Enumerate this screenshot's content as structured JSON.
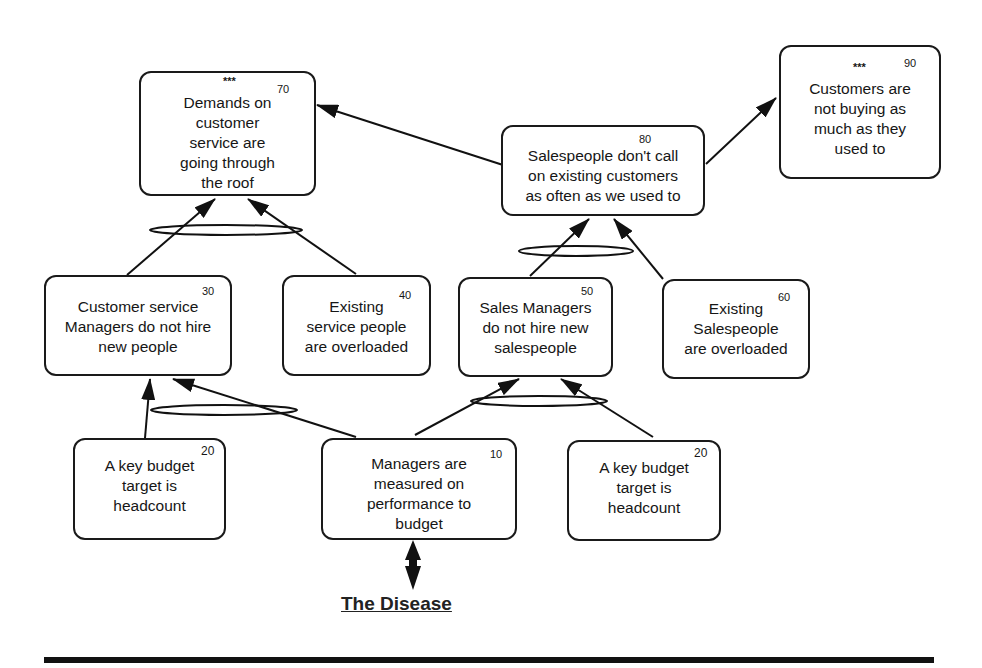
{
  "diagram": {
    "title": "The Disease",
    "nodes": [
      {
        "id": 70,
        "number": "70",
        "stars": "***",
        "label": "Demands on customer service are going through the roof"
      },
      {
        "id": 80,
        "number": "80",
        "label": "Salespeople  don't call on existing customers as often as we used to"
      },
      {
        "id": 90,
        "number": "90",
        "stars": "***",
        "label": "Customers are not buying as much as they used to"
      },
      {
        "id": 30,
        "number": "30",
        "label": "Customer service Managers do not hire new people"
      },
      {
        "id": 40,
        "number": "40",
        "label": "Existing service people are overloaded"
      },
      {
        "id": 50,
        "number": "50",
        "label": "Sales Managers do not hire new salespeople"
      },
      {
        "id": 60,
        "number": "60",
        "label": "Existing Salespeople are overloaded"
      },
      {
        "id": "20a",
        "number": "20",
        "label": "A key budget target is headcount"
      },
      {
        "id": 10,
        "number": "10",
        "label": "Managers are measured on performance to budget"
      },
      {
        "id": "20b",
        "number": "20",
        "label": "A key budget target is headcount"
      }
    ],
    "edges": [
      {
        "from": "80",
        "to": "70"
      },
      {
        "from": "80",
        "to": "90"
      },
      {
        "from": "30",
        "to": "70",
        "and_group": "A"
      },
      {
        "from": "40",
        "to": "70",
        "and_group": "A"
      },
      {
        "from": "50",
        "to": "80",
        "and_group": "B"
      },
      {
        "from": "60",
        "to": "80",
        "and_group": "B"
      },
      {
        "from": "20a",
        "to": "30",
        "and_group": "C"
      },
      {
        "from": "10",
        "to": "30",
        "and_group": "C"
      },
      {
        "from": "10",
        "to": "50",
        "and_group": "D"
      },
      {
        "from": "20b",
        "to": "50",
        "and_group": "D"
      },
      {
        "from": "10",
        "to": "title",
        "type": "bidirectional"
      }
    ]
  },
  "nodes": {
    "n70": {
      "num": "70",
      "stars": "***",
      "l1": "Demands on",
      "l2": "customer",
      "l3": "service are",
      "l4": "going through",
      "l5": "the roof"
    },
    "n80": {
      "num": "80",
      "l1": "Salespeople  don't call",
      "l2": "on existing customers",
      "l3": "as often as we used to"
    },
    "n90": {
      "num": "90",
      "stars": "***",
      "l1": "Customers are",
      "l2": "not buying as",
      "l3": "much as they",
      "l4": "used to"
    },
    "n30": {
      "num": "30",
      "l1": "Customer service",
      "l2": "Managers do not hire",
      "l3": "new people"
    },
    "n40": {
      "num": "40",
      "l1": "Existing",
      "l2": "service people",
      "l3": "are overloaded"
    },
    "n50": {
      "num": "50",
      "l1": "Sales Managers",
      "l2": "do not hire new",
      "l3": "salespeople"
    },
    "n60": {
      "num": "60",
      "l1": "Existing",
      "l2": "Salespeople",
      "l3": "are overloaded"
    },
    "n20a": {
      "num": "20",
      "l1": "A key budget",
      "l2": "target is",
      "l3": "headcount"
    },
    "n10": {
      "num": "10",
      "l1": "Managers are",
      "l2": "measured on",
      "l3": "performance to",
      "l4": "budget"
    },
    "n20b": {
      "num": "20",
      "l1": "A key budget",
      "l2": "target is",
      "l3": "headcount"
    }
  },
  "title": "The Disease"
}
